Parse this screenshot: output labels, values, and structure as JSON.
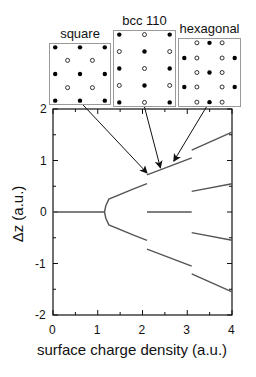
{
  "insets": [
    {
      "title": "square",
      "box": {
        "x": 49,
        "y": 43,
        "w": 62,
        "h": 62
      },
      "points": [
        {
          "x": 0.1,
          "y": 0.07,
          "filled": true
        },
        {
          "x": 0.5,
          "y": 0.07,
          "filled": true
        },
        {
          "x": 0.9,
          "y": 0.07,
          "filled": true
        },
        {
          "x": 0.3,
          "y": 0.28,
          "filled": false
        },
        {
          "x": 0.7,
          "y": 0.28,
          "filled": false
        },
        {
          "x": 0.1,
          "y": 0.5,
          "filled": true
        },
        {
          "x": 0.5,
          "y": 0.5,
          "filled": true
        },
        {
          "x": 0.9,
          "y": 0.5,
          "filled": true
        },
        {
          "x": 0.3,
          "y": 0.72,
          "filled": false
        },
        {
          "x": 0.7,
          "y": 0.72,
          "filled": false
        },
        {
          "x": 0.1,
          "y": 0.93,
          "filled": true
        },
        {
          "x": 0.5,
          "y": 0.93,
          "filled": true
        },
        {
          "x": 0.9,
          "y": 0.93,
          "filled": true
        }
      ]
    },
    {
      "title": "bcc 110",
      "box": {
        "x": 113,
        "y": 30,
        "w": 63,
        "h": 77
      },
      "points": [
        {
          "x": 0.1,
          "y": 0.06,
          "filled": true
        },
        {
          "x": 0.5,
          "y": 0.06,
          "filled": false
        },
        {
          "x": 0.9,
          "y": 0.06,
          "filled": true
        },
        {
          "x": 0.1,
          "y": 0.28,
          "filled": false
        },
        {
          "x": 0.5,
          "y": 0.28,
          "filled": true
        },
        {
          "x": 0.9,
          "y": 0.28,
          "filled": false
        },
        {
          "x": 0.1,
          "y": 0.5,
          "filled": true
        },
        {
          "x": 0.5,
          "y": 0.5,
          "filled": false
        },
        {
          "x": 0.9,
          "y": 0.5,
          "filled": true
        },
        {
          "x": 0.1,
          "y": 0.72,
          "filled": false
        },
        {
          "x": 0.5,
          "y": 0.72,
          "filled": true
        },
        {
          "x": 0.9,
          "y": 0.72,
          "filled": false
        },
        {
          "x": 0.1,
          "y": 0.94,
          "filled": true
        },
        {
          "x": 0.5,
          "y": 0.94,
          "filled": false
        },
        {
          "x": 0.9,
          "y": 0.94,
          "filled": true
        }
      ]
    },
    {
      "title": "hexagonal",
      "box": {
        "x": 178,
        "y": 38,
        "w": 63,
        "h": 69
      },
      "points": [
        {
          "x": 0.3,
          "y": 0.07,
          "filled": false
        },
        {
          "x": 0.5,
          "y": 0.07,
          "filled": true
        },
        {
          "x": 0.7,
          "y": 0.07,
          "filled": false
        },
        {
          "x": 0.1,
          "y": 0.29,
          "filled": true
        },
        {
          "x": 0.3,
          "y": 0.29,
          "filled": false
        },
        {
          "x": 0.7,
          "y": 0.29,
          "filled": false
        },
        {
          "x": 0.9,
          "y": 0.29,
          "filled": true
        },
        {
          "x": 0.3,
          "y": 0.5,
          "filled": false
        },
        {
          "x": 0.5,
          "y": 0.5,
          "filled": true
        },
        {
          "x": 0.7,
          "y": 0.5,
          "filled": false
        },
        {
          "x": 0.1,
          "y": 0.71,
          "filled": true
        },
        {
          "x": 0.3,
          "y": 0.71,
          "filled": false
        },
        {
          "x": 0.7,
          "y": 0.71,
          "filled": false
        },
        {
          "x": 0.9,
          "y": 0.71,
          "filled": true
        },
        {
          "x": 0.3,
          "y": 0.93,
          "filled": false
        },
        {
          "x": 0.5,
          "y": 0.93,
          "filled": true
        },
        {
          "x": 0.7,
          "y": 0.93,
          "filled": false
        }
      ]
    }
  ],
  "chart_data": {
    "type": "line",
    "title": "",
    "xlabel": "surface charge density (a.u.)",
    "ylabel": "Δz (a.u.)",
    "xlim": [
      0,
      4
    ],
    "ylim": [
      -2,
      2
    ],
    "xticks": [
      "0",
      "1",
      "2",
      "3",
      "4"
    ],
    "yticks": [
      "2",
      "1",
      "0",
      "-1",
      "-2"
    ],
    "grid": false,
    "legend": "none",
    "series": [
      {
        "name": "single layer",
        "x": [
          0,
          1.15
        ],
        "y": [
          0,
          0
        ]
      },
      {
        "name": "upper branch (square)",
        "x": [
          1.15,
          1.18,
          1.25,
          1.8,
          2.1
        ],
        "y": [
          0.0,
          0.12,
          0.25,
          0.45,
          0.55
        ]
      },
      {
        "name": "lower branch (square)",
        "x": [
          1.15,
          1.18,
          1.25,
          1.8,
          2.1
        ],
        "y": [
          0.0,
          -0.12,
          -0.25,
          -0.45,
          -0.55
        ]
      },
      {
        "name": "upper (bcc 110)",
        "x": [
          2.1,
          3.1
        ],
        "y": [
          0.72,
          1.05
        ]
      },
      {
        "name": "lower (bcc 110)",
        "x": [
          2.1,
          3.1
        ],
        "y": [
          -0.72,
          -1.05
        ]
      },
      {
        "name": "middle (bcc 110)",
        "x": [
          2.1,
          3.1
        ],
        "y": [
          0,
          0
        ]
      },
      {
        "name": "top (hexagonal)",
        "x": [
          3.1,
          4.0
        ],
        "y": [
          1.2,
          1.55
        ]
      },
      {
        "name": "upper-mid (hexagonal)",
        "x": [
          3.1,
          4.0
        ],
        "y": [
          0.4,
          0.55
        ]
      },
      {
        "name": "lower-mid (hexagonal)",
        "x": [
          3.1,
          4.0
        ],
        "y": [
          -0.4,
          -0.55
        ]
      },
      {
        "name": "bottom (hexagonal)",
        "x": [
          3.1,
          4.0
        ],
        "y": [
          -1.2,
          -1.55
        ]
      }
    ],
    "annotations": [
      {
        "text": "square",
        "arrow_to": [
          2.1,
          0.72
        ]
      },
      {
        "text": "bcc 110",
        "arrow_to": [
          2.4,
          0.82
        ]
      },
      {
        "text": "hexagonal",
        "arrow_to": [
          2.7,
          0.95
        ]
      }
    ]
  },
  "colors": {
    "axis": "#111111",
    "curve": "#555555",
    "box_border": "#9a9a9a"
  }
}
